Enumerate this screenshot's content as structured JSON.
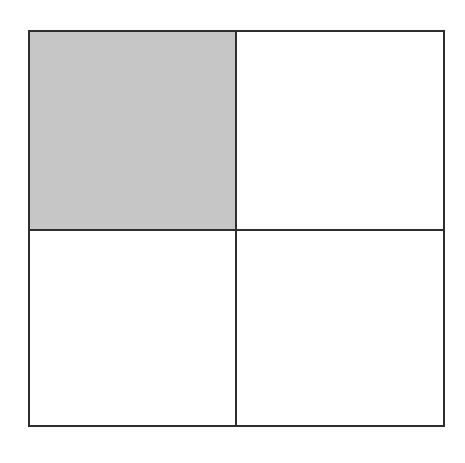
{
  "diagram": {
    "type": "2x2 grid",
    "rows": 2,
    "columns": 2,
    "line_color": "#2e2e2e",
    "cells": [
      {
        "row": 1,
        "col": 1,
        "shaded": true,
        "fill": "#c6c6c6"
      },
      {
        "row": 1,
        "col": 2,
        "shaded": false,
        "fill": "#ffffff"
      },
      {
        "row": 2,
        "col": 1,
        "shaded": false,
        "fill": "#ffffff"
      },
      {
        "row": 2,
        "col": 2,
        "shaded": false,
        "fill": "#ffffff"
      }
    ],
    "shaded_fraction": "1/4"
  }
}
